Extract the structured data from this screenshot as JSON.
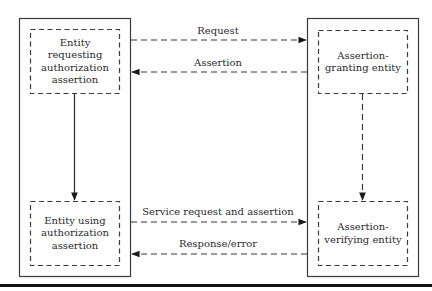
{
  "diagram": {
    "nodes": [
      {
        "id": "requester",
        "lines": [
          "Entity",
          "requesting",
          "authorization",
          "assertion"
        ]
      },
      {
        "id": "user",
        "lines": [
          "Entity using",
          "authorization",
          "assertion"
        ]
      },
      {
        "id": "granter",
        "lines": [
          "Assertion-",
          "granting entity"
        ]
      },
      {
        "id": "verifier",
        "lines": [
          "Assertion-",
          "verifying entity"
        ]
      }
    ],
    "edges": [
      {
        "from": "requester",
        "to": "granter",
        "label": "Request",
        "style": "dashed"
      },
      {
        "from": "granter",
        "to": "requester",
        "label": "Assertion",
        "style": "dashed"
      },
      {
        "from": "user",
        "to": "verifier",
        "label": "Service request and assertion",
        "style": "dashed"
      },
      {
        "from": "verifier",
        "to": "user",
        "label": "Response/error",
        "style": "dashed"
      },
      {
        "from": "requester",
        "to": "user",
        "label": "",
        "style": "solid"
      },
      {
        "from": "granter",
        "to": "verifier",
        "label": "",
        "style": "dashed"
      }
    ],
    "colors": {
      "line": "#2a2a2a",
      "background": "#ffffff"
    }
  }
}
